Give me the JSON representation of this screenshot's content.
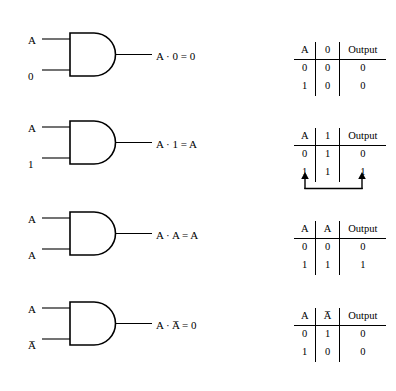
{
  "figure": {
    "gate_type": "AND",
    "stroke_color": "#000000",
    "background_color": "#ffffff"
  },
  "rows": [
    {
      "id": "and-rule-zero",
      "inputs": {
        "top": "A",
        "bottom": "0"
      },
      "output_expression": "A · 0 = 0",
      "table": {
        "headers": [
          "A",
          "0",
          "Output"
        ],
        "rows": [
          [
            "0",
            "0",
            "0"
          ],
          [
            "1",
            "0",
            "0"
          ]
        ],
        "has_arrows": false
      }
    },
    {
      "id": "and-rule-one",
      "inputs": {
        "top": "A",
        "bottom": "1"
      },
      "output_expression": "A · 1 = A",
      "table": {
        "headers": [
          "A",
          "1",
          "Output"
        ],
        "rows": [
          [
            "0",
            "1",
            "0"
          ],
          [
            "1",
            "1",
            "1"
          ]
        ],
        "has_arrows": true,
        "arrow_note": "arrows from A column and Output column joined below table"
      }
    },
    {
      "id": "and-rule-idempotent",
      "inputs": {
        "top": "A",
        "bottom": "A"
      },
      "output_expression": "A · A = A",
      "table": {
        "headers": [
          "A",
          "A",
          "Output"
        ],
        "rows": [
          [
            "0",
            "0",
            "0"
          ],
          [
            "1",
            "1",
            "1"
          ]
        ],
        "has_arrows": false
      }
    },
    {
      "id": "and-rule-complement",
      "inputs": {
        "top": "A",
        "bottom": "A̅"
      },
      "output_expression": "A · A̅ = 0",
      "table": {
        "headers": [
          "A",
          "A̅",
          "Output"
        ],
        "rows": [
          [
            "0",
            "1",
            "0"
          ],
          [
            "1",
            "0",
            "0"
          ]
        ],
        "has_arrows": false
      }
    }
  ]
}
